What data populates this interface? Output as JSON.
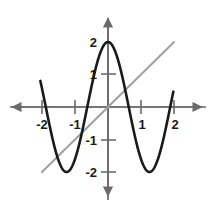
{
  "chart_data": {
    "type": "line",
    "title": "",
    "subtitle": "",
    "xlabel": "",
    "ylabel": "",
    "xlim": [
      -2.25,
      2.25
    ],
    "ylim": [
      -2.55,
      2.55
    ],
    "grid": false,
    "legend": "none",
    "x_ticks": [
      -2,
      -1,
      1,
      2
    ],
    "x_tick_labels": [
      "-2",
      "-1",
      "1",
      "2"
    ],
    "y_ticks": [
      2,
      1,
      -1,
      -2
    ],
    "y_tick_labels": [
      "2",
      "1",
      "-1",
      "-2"
    ],
    "axis_color": "#6b6b6b",
    "series": [
      {
        "name": "cosine-curve",
        "type": "line",
        "color": "#1a1a1a",
        "width": 2.6,
        "equation": "y = 2 cos(2.5 x)",
        "amplitude": 2,
        "period": 2.513,
        "x_range": [
          -2.05,
          1.98
        ],
        "x": [
          -2.05,
          -1.95,
          -1.85,
          -1.75,
          -1.65,
          -1.55,
          -1.45,
          -1.35,
          -1.25,
          -1.15,
          -1.05,
          -0.95,
          -0.85,
          -0.75,
          -0.65,
          -0.55,
          -0.45,
          -0.35,
          -0.25,
          -0.15,
          -0.05,
          0.05,
          0.15,
          0.25,
          0.35,
          0.45,
          0.55,
          0.65,
          0.75,
          0.85,
          0.95,
          1.05,
          1.15,
          1.25,
          1.35,
          1.45,
          1.55,
          1.65,
          1.75,
          1.85,
          1.95,
          1.98
        ],
        "y": [
          1.31,
          0.79,
          0.23,
          -0.33,
          -0.86,
          -1.33,
          -1.7,
          -1.93,
          -2.0,
          -1.9,
          -1.65,
          -1.26,
          -0.76,
          -0.2,
          0.38,
          0.93,
          1.4,
          1.75,
          1.94,
          1.98,
          1.99,
          1.99,
          1.98,
          1.94,
          1.75,
          1.4,
          0.93,
          0.38,
          -0.2,
          -0.76,
          -1.26,
          -1.65,
          -1.9,
          -2.0,
          -1.93,
          -1.7,
          -1.33,
          -0.86,
          -0.33,
          0.23,
          0.79,
          1.31
        ],
        "maxima": [
          {
            "x": 0,
            "y": 2
          }
        ],
        "minima": [
          {
            "x": -1.26,
            "y": -2
          },
          {
            "x": 1.26,
            "y": -2
          }
        ],
        "x_intercepts": [
          -1.88,
          -0.63,
          0.63,
          1.88
        ]
      },
      {
        "name": "identity-line",
        "type": "line",
        "color": "#a0a0a0",
        "width": 2.0,
        "equation": "y = x",
        "slope": 1,
        "intercept": 0,
        "x": [
          -2.0,
          2.0
        ],
        "y": [
          -2.0,
          2.0
        ]
      }
    ],
    "annotations": []
  },
  "axes": {
    "origin_label": "",
    "x_arrow_left": "arrow-left",
    "x_arrow_right": "arrow-right",
    "y_arrow_up": "arrow-up",
    "y_arrow_down": "arrow-down"
  }
}
